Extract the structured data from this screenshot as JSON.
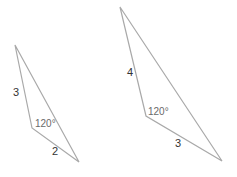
{
  "figures": [
    {
      "id": "triangle-1",
      "vertices": {
        "apex": [
          15,
          45
        ],
        "obtuse": [
          32,
          128
        ],
        "right": [
          79,
          162
        ]
      },
      "labels": {
        "side_a": "3",
        "side_b": "2",
        "angle": "120°"
      }
    },
    {
      "id": "triangle-2",
      "vertices": {
        "apex": [
          120,
          7
        ],
        "obtuse": [
          146,
          116
        ],
        "right": [
          222,
          161
        ]
      },
      "labels": {
        "side_a": "4",
        "side_b": "3",
        "angle": "120°"
      }
    }
  ],
  "colors": {
    "edge": "#a9a9a9",
    "text": "#333333"
  }
}
